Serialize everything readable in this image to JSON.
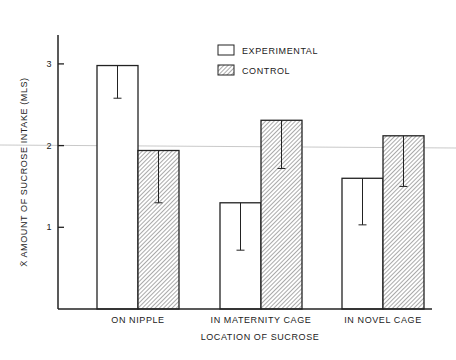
{
  "chart_data": {
    "type": "bar",
    "title": "",
    "xlabel": "LOCATION OF SUCROSE",
    "ylabel": "X̄ AMOUNT OF SUCROSE INTAKE (MLS)",
    "ylim": [
      0,
      3.4
    ],
    "yticks": [
      1,
      2,
      3
    ],
    "ytick_labels": [
      "1",
      "2",
      "3"
    ],
    "grid": false,
    "legend_position": "top-center",
    "categories": [
      "ON NIPPLE",
      "IN MATERNITY CAGE",
      "IN NOVEL CAGE"
    ],
    "series": [
      {
        "name": "EXPERIMENTAL",
        "pattern": "open",
        "values": [
          2.98,
          1.3,
          1.6
        ],
        "error_lower": [
          2.58,
          0.72,
          1.03
        ]
      },
      {
        "name": "CONTROL",
        "pattern": "hatched",
        "values": [
          1.94,
          2.31,
          2.12
        ],
        "error_lower": [
          1.3,
          1.72,
          1.5
        ]
      }
    ],
    "colors": {
      "axis": "#222222",
      "hatch": "#555555",
      "background": "#ffffff",
      "stray_line": "#bbbbbb"
    }
  }
}
